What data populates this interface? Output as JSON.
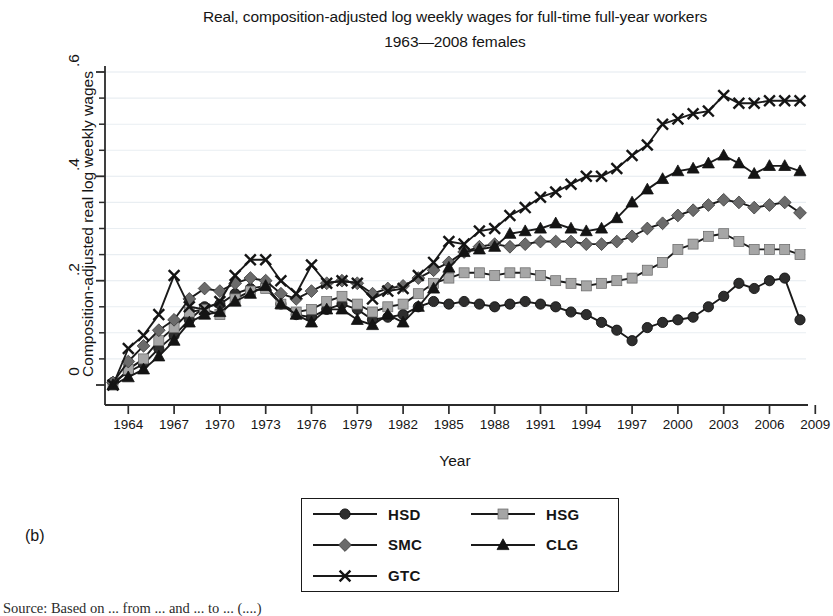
{
  "chart_data": {
    "type": "line",
    "title": "Real, composition-adjusted log weekly wages for full-time full-year workers",
    "subtitle": "1963—2008 females",
    "xlabel": "Year",
    "ylabel": "Composition-adjusted real log weekly wages",
    "xlim": [
      1963,
      2008
    ],
    "ylim": [
      0,
      0.6
    ],
    "grid": true,
    "grid_minor": true,
    "legend_position": "below-center",
    "panel_label": "(b)",
    "xticks": [
      "1964",
      "1967",
      "1970",
      "1973",
      "1976",
      "1979",
      "1982",
      "1985",
      "1988",
      "1991",
      "1994",
      "1997",
      "2000",
      "2003",
      "2006",
      "2009"
    ],
    "xtick_values": [
      1964,
      1967,
      1970,
      1973,
      1976,
      1979,
      1982,
      1985,
      1988,
      1991,
      1994,
      1997,
      2000,
      2003,
      2006,
      2009
    ],
    "yticks": [
      "0",
      ".2",
      ".4",
      ".6"
    ],
    "ytick_values": [
      0,
      0.2,
      0.4,
      0.6
    ],
    "yticks_minor": [
      0.05,
      0.1,
      0.15,
      0.25,
      0.3,
      0.35,
      0.45,
      0.5,
      0.55
    ],
    "x": [
      1963,
      1964,
      1965,
      1966,
      1967,
      1968,
      1969,
      1970,
      1971,
      1972,
      1973,
      1974,
      1975,
      1976,
      1977,
      1978,
      1979,
      1980,
      1981,
      1982,
      1983,
      1984,
      1985,
      1986,
      1987,
      1988,
      1989,
      1990,
      1991,
      1992,
      1993,
      1994,
      1995,
      1996,
      1997,
      1998,
      1999,
      2000,
      2001,
      2002,
      2003,
      2004,
      2005,
      2006,
      2007,
      2008
    ],
    "series": [
      {
        "name": "HSD",
        "marker": "circle",
        "color": "#2e2e2e",
        "line_color": "#1a1a1a",
        "values": [
          0.005,
          0.025,
          0.04,
          0.07,
          0.095,
          0.125,
          0.15,
          0.155,
          0.175,
          0.185,
          0.19,
          0.155,
          0.135,
          0.13,
          0.145,
          0.155,
          0.145,
          0.125,
          0.13,
          0.135,
          0.15,
          0.16,
          0.155,
          0.16,
          0.155,
          0.15,
          0.155,
          0.16,
          0.155,
          0.15,
          0.14,
          0.135,
          0.12,
          0.105,
          0.085,
          0.11,
          0.12,
          0.125,
          0.13,
          0.15,
          0.17,
          0.195,
          0.185,
          0.2,
          0.205,
          0.125
        ]
      },
      {
        "name": "HSG",
        "marker": "square",
        "color": "#a6a6a6",
        "line_color": "#1a1a1a",
        "values": [
          0.0,
          0.03,
          0.05,
          0.085,
          0.11,
          0.14,
          0.145,
          0.135,
          0.165,
          0.18,
          0.185,
          0.155,
          0.14,
          0.145,
          0.16,
          0.17,
          0.155,
          0.14,
          0.15,
          0.155,
          0.175,
          0.195,
          0.205,
          0.215,
          0.215,
          0.21,
          0.215,
          0.215,
          0.21,
          0.2,
          0.195,
          0.19,
          0.195,
          0.2,
          0.205,
          0.22,
          0.235,
          0.26,
          0.27,
          0.285,
          0.29,
          0.275,
          0.26,
          0.26,
          0.26,
          0.25
        ]
      },
      {
        "name": "SMC",
        "marker": "diamond",
        "color": "#6b6b6b",
        "line_color": "#1a1a1a",
        "values": [
          0.005,
          0.045,
          0.075,
          0.105,
          0.125,
          0.165,
          0.185,
          0.18,
          0.195,
          0.205,
          0.2,
          0.175,
          0.165,
          0.18,
          0.195,
          0.2,
          0.195,
          0.175,
          0.185,
          0.19,
          0.205,
          0.22,
          0.235,
          0.255,
          0.265,
          0.27,
          0.265,
          0.27,
          0.275,
          0.275,
          0.275,
          0.27,
          0.27,
          0.275,
          0.285,
          0.3,
          0.31,
          0.325,
          0.335,
          0.345,
          0.355,
          0.35,
          0.34,
          0.345,
          0.35,
          0.33
        ]
      },
      {
        "name": "CLG",
        "marker": "triangle",
        "color": "#141414",
        "line_color": "#1a1a1a",
        "values": [
          0.0,
          0.015,
          0.03,
          0.055,
          0.085,
          0.12,
          0.135,
          0.14,
          0.16,
          0.175,
          0.19,
          0.155,
          0.135,
          0.12,
          0.145,
          0.145,
          0.125,
          0.115,
          0.135,
          0.12,
          0.15,
          0.185,
          0.225,
          0.255,
          0.26,
          0.265,
          0.29,
          0.295,
          0.3,
          0.31,
          0.3,
          0.295,
          0.3,
          0.32,
          0.35,
          0.375,
          0.395,
          0.41,
          0.415,
          0.425,
          0.44,
          0.425,
          0.405,
          0.42,
          0.42,
          0.41
        ]
      },
      {
        "name": "GTC",
        "marker": "cross",
        "color": "#141414",
        "line_color": "#1a1a1a",
        "values": [
          0.0,
          0.07,
          0.095,
          0.135,
          0.21,
          0.15,
          0.145,
          0.16,
          0.21,
          0.24,
          0.24,
          0.2,
          0.175,
          0.23,
          0.195,
          0.2,
          0.195,
          0.165,
          0.18,
          0.185,
          0.21,
          0.235,
          0.275,
          0.27,
          0.295,
          0.3,
          0.325,
          0.34,
          0.36,
          0.37,
          0.385,
          0.4,
          0.4,
          0.415,
          0.44,
          0.46,
          0.5,
          0.51,
          0.52,
          0.525,
          0.555,
          0.54,
          0.54,
          0.545,
          0.545,
          0.545
        ]
      }
    ]
  },
  "legend": {
    "entries": [
      {
        "label": "HSD",
        "marker": "circle",
        "color": "#2e2e2e"
      },
      {
        "label": "HSG",
        "marker": "square",
        "color": "#a6a6a6"
      },
      {
        "label": "SMC",
        "marker": "diamond",
        "color": "#6b6b6b"
      },
      {
        "label": "CLG",
        "marker": "triangle",
        "color": "#141414"
      },
      {
        "label": "GTC",
        "marker": "cross",
        "color": "#141414"
      }
    ]
  },
  "caption": "Source: Based on ... from ... and ... to ... (....)"
}
